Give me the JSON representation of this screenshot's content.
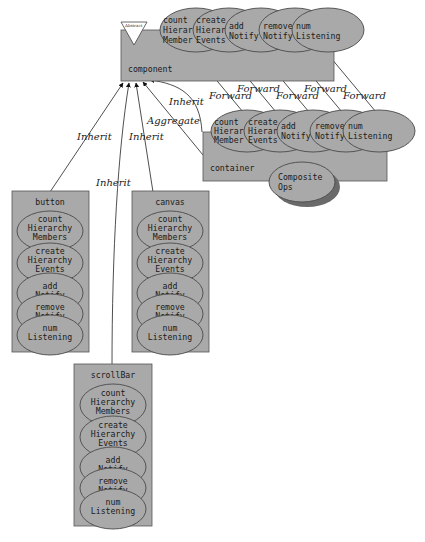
{
  "diagram": {
    "type": "class-relationship-diagram",
    "colors": {
      "node_fill": "#a9a9a9",
      "stroke": "#4a4a4a",
      "background": "#ffffff"
    },
    "nodes": {
      "component": {
        "label": "component",
        "stereotype": "Abstract",
        "methods": [
          [
            "count",
            "Hierar",
            "Member"
          ],
          [
            "create",
            "Hierar",
            "Events"
          ],
          [
            "add",
            "Notify"
          ],
          [
            "remove",
            "Notify"
          ],
          [
            "num",
            "Listening"
          ]
        ]
      },
      "container": {
        "label": "container",
        "methods": [
          [
            "count",
            "Hierar",
            "Member"
          ],
          [
            "create",
            "Hierar",
            "Events"
          ],
          [
            "add",
            "Notify"
          ],
          [
            "remove",
            "Notify"
          ],
          [
            "num",
            "Listening"
          ]
        ],
        "extra": [
          "Composite",
          "Ops"
        ]
      },
      "button": {
        "label": "button",
        "methods": [
          [
            "count",
            "Hierarchy",
            "Members"
          ],
          [
            "create",
            "Hierarchy",
            "Events"
          ],
          [
            "add",
            "Notify"
          ],
          [
            "remove",
            "Notify"
          ],
          [
            "num",
            "Listening"
          ]
        ]
      },
      "canvas": {
        "label": "canvas",
        "methods": [
          [
            "count",
            "Hierarchy",
            "Members"
          ],
          [
            "create",
            "Hierarchy",
            "Events"
          ],
          [
            "add",
            "Notify"
          ],
          [
            "remove",
            "Notify"
          ],
          [
            "num",
            "Listening"
          ]
        ]
      },
      "scrollBar": {
        "label": "scrollBar",
        "methods": [
          [
            "count",
            "Hierarchy",
            "Members"
          ],
          [
            "create",
            "Hierarchy",
            "Events"
          ],
          [
            "add",
            "Notify"
          ],
          [
            "remove",
            "Notify"
          ],
          [
            "num",
            "Listening"
          ]
        ]
      }
    },
    "edges": {
      "button_inherit": "Inherit",
      "scrollbar_inherit": "Inherit",
      "canvas_inherit": "Inherit",
      "container_aggregate": "Aggregate",
      "container_inherit": "Inherit",
      "forward_1": "Forward",
      "forward_2": "Forward",
      "forward_3": "Forward",
      "forward_4": "Forward",
      "forward_5": "Forward"
    }
  }
}
